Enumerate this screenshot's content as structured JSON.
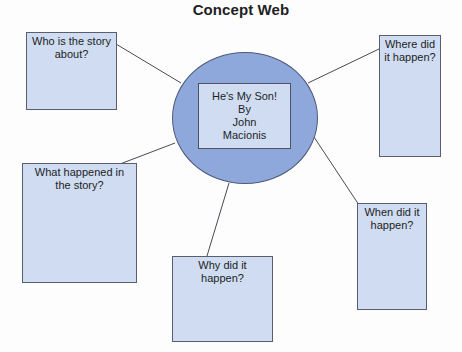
{
  "title": "Concept Web",
  "center": {
    "lines": [
      "He's My Son!",
      "By",
      "John",
      "Macionis"
    ]
  },
  "boxes": {
    "who": "Who is the story about?",
    "where": "Where did it happen?",
    "what": "What happened in the story?",
    "why": "Why did it happen?",
    "when": "When did it happen?"
  },
  "colors": {
    "hub_fill": "#8fa8dc",
    "box_fill": "#cfdcf2",
    "line": "#4a4a55"
  }
}
